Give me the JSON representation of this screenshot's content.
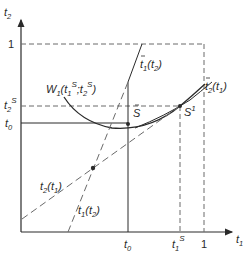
{
  "diagram": {
    "axes": {
      "x_label": "t",
      "x_label_sub": "1",
      "y_label": "t",
      "y_label_sub": "2"
    },
    "x_ticks": [
      {
        "base": "t",
        "sub": "0",
        "sup": ""
      },
      {
        "base": "t",
        "sub": "1",
        "sup": "S"
      },
      {
        "base": "1",
        "sub": "",
        "sup": ""
      }
    ],
    "y_ticks": [
      {
        "base": "1",
        "sub": "",
        "sup": ""
      },
      {
        "base": "t",
        "sub": "2",
        "sup": "S"
      },
      {
        "base": "t",
        "sub": "0",
        "sup": ""
      }
    ],
    "curves": {
      "indifference": {
        "name": "W",
        "sub": "1",
        "args_open": "(t",
        "arg1_sub": "1",
        "arg1_sup": "S",
        "sep": ";t",
        "arg2_sub": "2",
        "arg2_sup": "S",
        "close": ")"
      },
      "bar_t1_t2": {
        "base": "t",
        "sub": "1",
        "arg": "(t",
        "arg_sub": "2",
        "close": ")"
      },
      "bar_t2_t1": {
        "base": "t",
        "sub": "2",
        "arg": "(t",
        "arg_sub": "1",
        "close": ")"
      },
      "t2_t1": {
        "base": "t",
        "sub": "2",
        "arg": "(t",
        "arg_sub": "1",
        "close": ")"
      },
      "t1_t2": {
        "base": "t",
        "sub": "1",
        "arg": "(t",
        "arg_sub": "2",
        "close": ")"
      }
    },
    "points": {
      "S": {
        "label": "S"
      },
      "S1": {
        "label": "S",
        "sup": "1"
      }
    },
    "colors": {
      "line": "#2a2a2a",
      "dashed": "#6a6a6a",
      "background": "#ffffff"
    }
  }
}
